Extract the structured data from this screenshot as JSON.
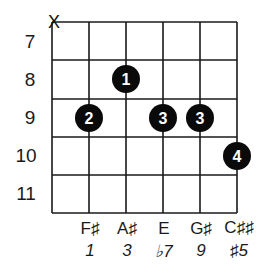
{
  "chord": {
    "muted_marker": "X",
    "frets": [
      "7",
      "8",
      "9",
      "10",
      "11"
    ],
    "strings": 6,
    "fingers": [
      {
        "finger": "1",
        "string": 3,
        "fret": "8"
      },
      {
        "finger": "2",
        "string": 2,
        "fret": "9"
      },
      {
        "finger": "3",
        "string": 4,
        "fret": "9"
      },
      {
        "finger": "3",
        "string": 5,
        "fret": "9"
      },
      {
        "finger": "4",
        "string": 6,
        "fret": "10"
      }
    ],
    "notes": [
      "F♯",
      "A♯",
      "E",
      "G♯",
      "C♯♯"
    ],
    "intervals": [
      "1",
      "3",
      "♭7",
      "9",
      "♯5"
    ],
    "colors": {
      "line": "#1a1a1a",
      "dot": "#0a0a0a",
      "dot_text": "#ffffff",
      "background": "#ffffff"
    }
  }
}
